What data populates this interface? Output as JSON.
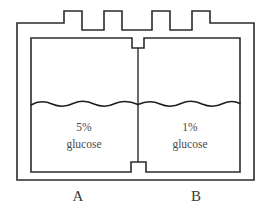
{
  "figure": {
    "background_color": "#ffffff",
    "line_color": "#2b2b2b",
    "text_color": "#4a4a4a"
  },
  "chambers": {
    "left": {
      "id": "A",
      "letter_label": "A",
      "concentration": "5%",
      "solute": "glucose"
    },
    "right": {
      "id": "B",
      "letter_label": "B",
      "concentration": "1%",
      "solute": "glucose"
    }
  },
  "liquid": {
    "surface_style": "wavy-line",
    "levels_equal": true,
    "left_level_y": 104,
    "right_level_y": 104
  },
  "membrane": {
    "orientation": "vertical",
    "position_x": 138,
    "description": "central dividing membrane"
  }
}
